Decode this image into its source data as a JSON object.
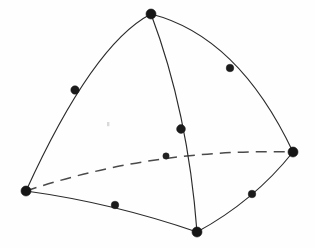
{
  "figure": {
    "background_color": "#fefefe",
    "line_color": "#2b2b2b",
    "node_color": "#161616",
    "hidden_edge_color": "#4a4a4a",
    "width": 315,
    "height": 248
  },
  "geometry": {
    "vertices": [
      {
        "id": "v-apex",
        "label": "apex vertex",
        "x": 151,
        "y": 14,
        "r": 5.0
      },
      {
        "id": "v-left",
        "label": "left vertex",
        "x": 26,
        "y": 191,
        "r": 5.0
      },
      {
        "id": "v-right",
        "label": "right vertex",
        "x": 293,
        "y": 152,
        "r": 5.0
      },
      {
        "id": "v-bottom",
        "label": "bottom vertex",
        "x": 197,
        "y": 232,
        "r": 5.0
      }
    ],
    "midside_nodes": [
      {
        "id": "m-apex-left",
        "label": "apex-left midside node",
        "x": 75,
        "y": 90,
        "r": 4.2,
        "hidden": false
      },
      {
        "id": "m-apex-right",
        "label": "apex-right midside node",
        "x": 230,
        "y": 68,
        "r": 3.8,
        "hidden": false
      },
      {
        "id": "m-apex-bottom",
        "label": "apex-bottom midside node",
        "x": 181,
        "y": 129,
        "r": 4.4,
        "hidden": false
      },
      {
        "id": "m-left-bottom",
        "label": "left-bottom midside node",
        "x": 115,
        "y": 205,
        "r": 3.8,
        "hidden": false
      },
      {
        "id": "m-bottom-right",
        "label": "bottom-right midside node",
        "x": 252,
        "y": 194,
        "r": 3.8,
        "hidden": false
      },
      {
        "id": "m-left-right",
        "label": "left-right hidden midside node",
        "x": 166,
        "y": 156,
        "r": 3.2,
        "hidden": true
      }
    ],
    "edges": [
      {
        "id": "e-apex-left",
        "label": "apex to left edge",
        "style": "solid",
        "path": "M 151 14 Q 93 44 26 191"
      },
      {
        "id": "e-apex-right",
        "label": "apex to right edge",
        "style": "solid",
        "path": "M 151 14 Q 238 36 293 152"
      },
      {
        "id": "e-apex-bottom",
        "label": "apex to bottom edge",
        "style": "solid",
        "path": "M 151 14 Q 188 112 197 232"
      },
      {
        "id": "e-left-bottom",
        "label": "left to bottom edge",
        "style": "solid",
        "path": "M 26 191 Q 113 203 197 232"
      },
      {
        "id": "e-bottom-right",
        "label": "bottom to right edge",
        "style": "solid",
        "path": "M 197 232 Q 254 201 293 152"
      },
      {
        "id": "e-left-right",
        "label": "left to right hidden edge",
        "style": "dashed",
        "dash_pattern": "11 7",
        "path": "M 26 191 Q 154 148 293 152"
      }
    ],
    "speck": {
      "id": "scan-speck",
      "label": "scan artifact",
      "x": 107,
      "y": 122,
      "w": 2.4,
      "h": 4.2
    }
  }
}
